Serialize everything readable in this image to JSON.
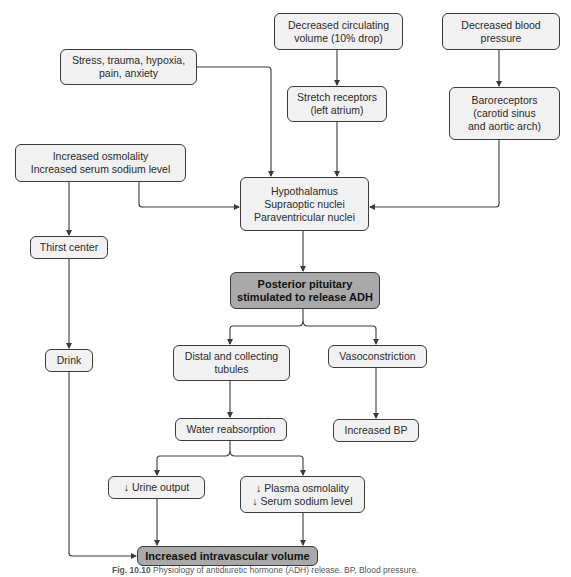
{
  "diagram": {
    "title": "Physiology of antidiuretic hormone (ADH) release",
    "nodes": {
      "stress": "Stress, trauma, hypoxia,\npain, anxiety",
      "decreased_volume": "Decreased circulating\nvolume (10% drop)",
      "decreased_bp": "Decreased blood\npressure",
      "stretch_receptors": "Stretch receptors\n(left atrium)",
      "baroreceptors": "Baroreceptors\n(carotid sinus\nand aortic arch)",
      "increased_osmolality": "Increased osmolality\nIncreased serum sodium level",
      "hypothalamus": "Hypothalamus\nSupraoptic nuclei\nParaventricular nuclei",
      "thirst_center": "Thirst center",
      "posterior_pituitary": "Posterior pituitary\nstimulated to release ADH",
      "distal_tubules": "Distal and collecting\ntubules",
      "vasoconstriction": "Vasoconstriction",
      "drink": "Drink",
      "water_reabsorption": "Water reabsorption",
      "increased_bp": "Increased BP",
      "urine_output": "↓ Urine output",
      "plasma_osmolality": "↓ Plasma osmolality\n↓ Serum sodium level",
      "intravascular_volume": "Increased intravascular volume"
    },
    "edges": [
      {
        "from": "stress",
        "to": "hypothalamus"
      },
      {
        "from": "decreased_volume",
        "to": "stretch_receptors"
      },
      {
        "from": "decreased_bp",
        "to": "baroreceptors"
      },
      {
        "from": "stretch_receptors",
        "to": "hypothalamus"
      },
      {
        "from": "baroreceptors",
        "to": "hypothalamus"
      },
      {
        "from": "increased_osmolality",
        "to": "hypothalamus"
      },
      {
        "from": "increased_osmolality",
        "to": "thirst_center"
      },
      {
        "from": "thirst_center",
        "to": "drink"
      },
      {
        "from": "hypothalamus",
        "to": "posterior_pituitary"
      },
      {
        "from": "posterior_pituitary",
        "to": "distal_tubules"
      },
      {
        "from": "posterior_pituitary",
        "to": "vasoconstriction"
      },
      {
        "from": "distal_tubules",
        "to": "water_reabsorption"
      },
      {
        "from": "vasoconstriction",
        "to": "increased_bp"
      },
      {
        "from": "water_reabsorption",
        "to": "urine_output"
      },
      {
        "from": "water_reabsorption",
        "to": "plasma_osmolality"
      },
      {
        "from": "urine_output",
        "to": "intravascular_volume"
      },
      {
        "from": "plasma_osmolality",
        "to": "intravascular_volume"
      },
      {
        "from": "drink",
        "to": "intravascular_volume"
      }
    ],
    "colors": {
      "node_fill": "#f1f1f1",
      "highlight_fill": "#a9a9a9",
      "line": "#3a3a3a"
    }
  },
  "caption": {
    "label": "Fig. 10.10",
    "text": " Physiology of antidiuretic hormone (ADH) release. BP, Blood pressure."
  }
}
